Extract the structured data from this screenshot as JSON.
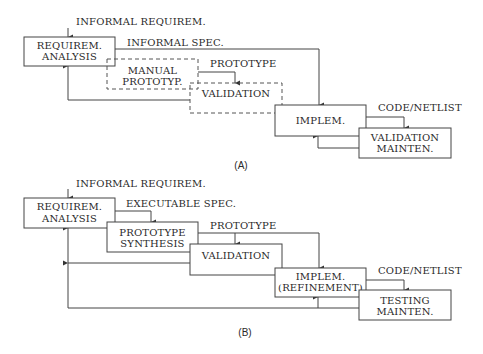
{
  "panel_a": {
    "caption": "(A)",
    "input_label": "INFORMAL REQUIREM.",
    "spec_label": "INFORMAL SPEC.",
    "prototype_label": "PROTOTYPE",
    "code_label": "CODE/NETLIST",
    "boxes": {
      "requirem": [
        "REQUIREM.",
        "ANALYSIS"
      ],
      "manual": [
        "MANUAL",
        "PROTOTYP."
      ],
      "validation": [
        "VALIDATION"
      ],
      "implem": [
        "IMPLEM."
      ],
      "maint": [
        "VALIDATION",
        "MAINTEN."
      ]
    }
  },
  "panel_b": {
    "caption": "(B)",
    "input_label": "INFORMAL REQUIREM.",
    "spec_label": "EXECUTABLE SPEC.",
    "prototype_label": "PROTOTYPE",
    "code_label": "CODE/NETLIST",
    "boxes": {
      "requirem": [
        "REQUIREM.",
        "ANALYSIS"
      ],
      "synthesis": [
        "PROTOTYPE",
        "SYNTHESIS"
      ],
      "validation": [
        "VALIDATION"
      ],
      "implem": [
        "IMPLEM.",
        "(REFINEMENT)"
      ],
      "testing": [
        "TESTING",
        "MAINTEN."
      ]
    }
  },
  "colors": {
    "line": "#444444",
    "text": "#2a2a2a",
    "background": "#ffffff"
  }
}
